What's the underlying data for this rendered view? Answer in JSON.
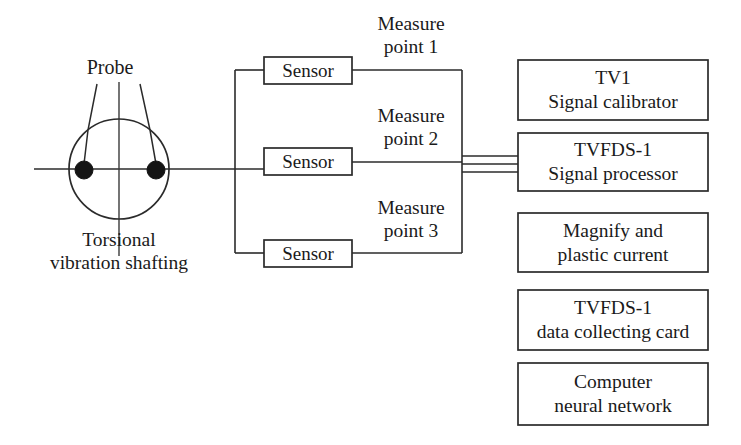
{
  "diagram": {
    "colors": {
      "line": "#2b2b2b",
      "text": "#1a1a1a",
      "background": "#ffffff",
      "probe_dot": "#141414"
    },
    "shaft": {
      "probe_label": "Probe",
      "caption_line1": "Torsional",
      "caption_line2": "vibration shafting"
    },
    "sensors": [
      {
        "label": "Sensor",
        "measure_line1": "Measure",
        "measure_line2": "point 1"
      },
      {
        "label": "Sensor",
        "measure_line1": "Measure",
        "measure_line2": "point 2"
      },
      {
        "label": "Sensor",
        "measure_line1": "Measure",
        "measure_line2": "point 3"
      }
    ],
    "units": [
      {
        "line1": "TV1",
        "line2": "Signal calibrator"
      },
      {
        "line1": "TVFDS-1",
        "line2": "Signal processor"
      },
      {
        "line1": "Magnify and",
        "line2": "plastic current"
      },
      {
        "line1": "TVFDS-1",
        "line2": "data collecting card"
      },
      {
        "line1": "Computer",
        "line2": "neural network"
      }
    ]
  }
}
